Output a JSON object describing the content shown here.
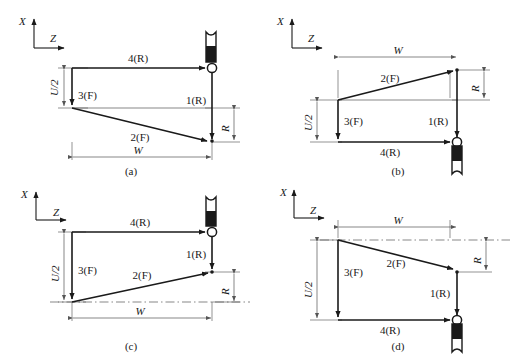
{
  "figure": {
    "type": "technical-diagram",
    "axes": {
      "x_label": "X",
      "z_label": "Z"
    },
    "panels": [
      {
        "id": "a",
        "caption": "(a)",
        "tool_position": "top-right",
        "tool_orientation": "up",
        "segments": [
          {
            "name": "1(R)",
            "label": "1(R)",
            "type": "rapid"
          },
          {
            "name": "2(F)",
            "label": "2(F)",
            "type": "feed"
          },
          {
            "name": "3(F)",
            "label": "3(F)",
            "type": "feed"
          },
          {
            "name": "4(R)",
            "label": "4(R)",
            "type": "rapid"
          }
        ],
        "dimensions": [
          {
            "name": "U/2",
            "label": "U/2",
            "orientation": "vertical",
            "side": "left"
          },
          {
            "name": "W",
            "label": "W",
            "orientation": "horizontal",
            "side": "bottom"
          },
          {
            "name": "R",
            "label": "R",
            "orientation": "vertical",
            "side": "right"
          }
        ]
      },
      {
        "id": "b",
        "caption": "(b)",
        "tool_position": "bottom-right",
        "tool_orientation": "down",
        "segments": [
          {
            "name": "1(R)",
            "label": "1(R)",
            "type": "rapid"
          },
          {
            "name": "2(F)",
            "label": "2(F)",
            "type": "feed"
          },
          {
            "name": "3(F)",
            "label": "3(F)",
            "type": "feed"
          },
          {
            "name": "4(R)",
            "label": "4(R)",
            "type": "rapid"
          }
        ],
        "dimensions": [
          {
            "name": "U/2",
            "label": "U/2",
            "orientation": "vertical",
            "side": "left"
          },
          {
            "name": "W",
            "label": "W",
            "orientation": "horizontal",
            "side": "top"
          },
          {
            "name": "R",
            "label": "R",
            "orientation": "vertical",
            "side": "right"
          }
        ]
      },
      {
        "id": "c",
        "caption": "(c)",
        "tool_position": "top-right",
        "tool_orientation": "up",
        "segments": [
          {
            "name": "1(R)",
            "label": "1(R)",
            "type": "rapid"
          },
          {
            "name": "2(F)",
            "label": "2(F)",
            "type": "feed"
          },
          {
            "name": "3(F)",
            "label": "3(F)",
            "type": "feed"
          },
          {
            "name": "4(R)",
            "label": "4(R)",
            "type": "rapid"
          }
        ],
        "dimensions": [
          {
            "name": "U/2",
            "label": "U/2",
            "orientation": "vertical",
            "side": "left"
          },
          {
            "name": "W",
            "label": "W",
            "orientation": "horizontal",
            "side": "bottom"
          },
          {
            "name": "R",
            "label": "R",
            "orientation": "vertical",
            "side": "right"
          }
        ]
      },
      {
        "id": "d",
        "caption": "(d)",
        "tool_position": "bottom-right",
        "tool_orientation": "down",
        "segments": [
          {
            "name": "1(R)",
            "label": "1(R)",
            "type": "rapid"
          },
          {
            "name": "2(F)",
            "label": "2(F)",
            "type": "feed"
          },
          {
            "name": "3(F)",
            "label": "3(F)",
            "type": "feed"
          },
          {
            "name": "4(R)",
            "label": "4(R)",
            "type": "rapid"
          }
        ],
        "dimensions": [
          {
            "name": "U/2",
            "label": "U/2",
            "orientation": "vertical",
            "side": "left"
          },
          {
            "name": "W",
            "label": "W",
            "orientation": "horizontal",
            "side": "top"
          },
          {
            "name": "R",
            "label": "R",
            "orientation": "vertical",
            "side": "right"
          }
        ]
      }
    ],
    "colors": {
      "line": "#1a1a1a",
      "thin_line": "#555555",
      "background": "#ffffff"
    }
  }
}
